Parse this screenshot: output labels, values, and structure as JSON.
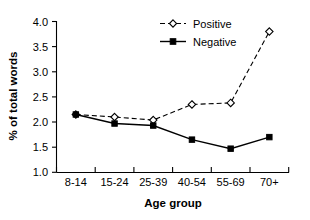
{
  "chart_data": {
    "type": "line",
    "title": "",
    "xlabel": "Age group",
    "ylabel": "% of total words",
    "categories": [
      "8-14",
      "15-24",
      "25-39",
      "40-54",
      "55-69",
      "70+"
    ],
    "series": [
      {
        "name": "Positive",
        "values": [
          2.15,
          2.1,
          2.04,
          2.35,
          2.38,
          3.8
        ],
        "line_style": "dashed",
        "marker": "open-diamond",
        "color": "#000000"
      },
      {
        "name": "Negative",
        "values": [
          2.15,
          1.97,
          1.93,
          1.65,
          1.47,
          1.7
        ],
        "line_style": "solid",
        "marker": "filled-square",
        "color": "#000000"
      }
    ],
    "ylim": [
      1.0,
      4.0
    ],
    "yticks": [
      "1.0",
      "1.5",
      "2.0",
      "2.5",
      "3.0",
      "3.5",
      "4.0"
    ],
    "ytick_values": [
      1.0,
      1.5,
      2.0,
      2.5,
      3.0,
      3.5,
      4.0
    ],
    "grid": false,
    "legend_position": "top-center",
    "background": "#ffffff"
  },
  "legend": {
    "entries": [
      {
        "label": "Positive"
      },
      {
        "label": "Negative"
      }
    ]
  }
}
